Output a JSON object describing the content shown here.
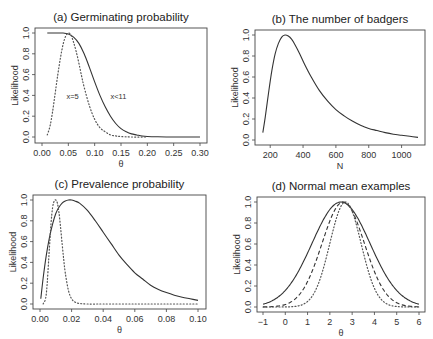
{
  "chart_data": [
    {
      "id": "a",
      "type": "line",
      "title": "(a) Germinating probability",
      "xlabel": "θ",
      "ylabel": "Likelihood",
      "xlim": [
        0.0,
        0.3
      ],
      "ylim": [
        0.0,
        1.0
      ],
      "xticks": [
        0.0,
        0.05,
        0.1,
        0.15,
        0.2,
        0.25,
        0.3
      ],
      "xtick_labels": [
        "0.00",
        "0.05",
        "0.10",
        "0.15",
        "0.20",
        "0.25",
        "0.30"
      ],
      "yticks": [
        0.0,
        0.2,
        0.4,
        0.6,
        0.8,
        1.0
      ],
      "ytick_labels": [
        "0.0",
        "0.2",
        "0.4",
        "0.6",
        "0.8",
        "1.0"
      ],
      "annotations": [
        {
          "text": "x=5",
          "x": 0.058,
          "y": 0.39
        },
        {
          "text": "x<11",
          "x": 0.145,
          "y": 0.39
        }
      ],
      "series": [
        {
          "name": "x<11",
          "style": "solid",
          "x": [
            0.01,
            0.02,
            0.03,
            0.04,
            0.05,
            0.06,
            0.07,
            0.08,
            0.09,
            0.1,
            0.11,
            0.12,
            0.13,
            0.14,
            0.15,
            0.16,
            0.17,
            0.18,
            0.19,
            0.2,
            0.22,
            0.25,
            0.3
          ],
          "y": [
            1.0,
            1.0,
            1.0,
            1.0,
            0.99,
            0.96,
            0.9,
            0.8,
            0.67,
            0.53,
            0.4,
            0.29,
            0.2,
            0.13,
            0.08,
            0.05,
            0.03,
            0.02,
            0.01,
            0.005,
            0.002,
            0.0,
            0.0
          ]
        },
        {
          "name": "x=5",
          "style": "dotted",
          "x": [
            0.01,
            0.015,
            0.02,
            0.025,
            0.03,
            0.035,
            0.04,
            0.045,
            0.05,
            0.055,
            0.06,
            0.065,
            0.07,
            0.075,
            0.08,
            0.09,
            0.1,
            0.11,
            0.12,
            0.13,
            0.14,
            0.15,
            0.17,
            0.2
          ],
          "y": [
            0.02,
            0.1,
            0.24,
            0.42,
            0.6,
            0.76,
            0.89,
            0.97,
            1.0,
            0.98,
            0.91,
            0.82,
            0.71,
            0.59,
            0.48,
            0.3,
            0.17,
            0.09,
            0.05,
            0.02,
            0.01,
            0.005,
            0.0,
            0.0
          ]
        }
      ]
    },
    {
      "id": "b",
      "type": "line",
      "title": "(b) The number of badgers",
      "xlabel": "N",
      "ylabel": "Likelihood",
      "xlim": [
        150,
        1100
      ],
      "ylim": [
        0.0,
        1.0
      ],
      "xticks": [
        200,
        400,
        600,
        800,
        1000
      ],
      "xtick_labels": [
        "200",
        "400",
        "600",
        "800",
        "1000"
      ],
      "yticks": [
        0.0,
        0.2,
        0.4,
        0.6,
        0.8,
        1.0
      ],
      "ytick_labels": [
        "0.0",
        "0.2",
        "0.4",
        "0.6",
        "0.8",
        "1.0"
      ],
      "series": [
        {
          "name": "likelihood",
          "style": "solid",
          "x": [
            155,
            170,
            190,
            210,
            230,
            250,
            270,
            290,
            310,
            330,
            350,
            380,
            410,
            450,
            500,
            550,
            600,
            650,
            700,
            750,
            800,
            850,
            900,
            950,
            1000,
            1050,
            1100
          ],
          "y": [
            0.07,
            0.22,
            0.45,
            0.66,
            0.82,
            0.92,
            0.98,
            1.0,
            0.99,
            0.96,
            0.91,
            0.82,
            0.72,
            0.6,
            0.47,
            0.37,
            0.29,
            0.23,
            0.18,
            0.14,
            0.11,
            0.09,
            0.07,
            0.055,
            0.045,
            0.035,
            0.025
          ]
        }
      ]
    },
    {
      "id": "c",
      "type": "line",
      "title": "(c) Prevalence probability",
      "xlabel": "θ",
      "ylabel": "Likelihood",
      "xlim": [
        0.0,
        0.1
      ],
      "ylim": [
        0.0,
        1.0
      ],
      "xticks": [
        0.0,
        0.02,
        0.04,
        0.06,
        0.08,
        0.1
      ],
      "xtick_labels": [
        "0.00",
        "0.02",
        "0.04",
        "0.06",
        "0.08",
        "0.10"
      ],
      "yticks": [
        0.0,
        0.2,
        0.4,
        0.6,
        0.8,
        1.0
      ],
      "ytick_labels": [
        "0.0",
        "0.2",
        "0.4",
        "0.6",
        "0.8",
        "1.0"
      ],
      "series": [
        {
          "name": "solid",
          "style": "solid",
          "x": [
            0.0005,
            0.002,
            0.004,
            0.006,
            0.008,
            0.01,
            0.012,
            0.014,
            0.016,
            0.018,
            0.02,
            0.022,
            0.025,
            0.03,
            0.035,
            0.04,
            0.045,
            0.05,
            0.055,
            0.06,
            0.065,
            0.07,
            0.075,
            0.08,
            0.085,
            0.09,
            0.095,
            0.1
          ],
          "y": [
            0.05,
            0.25,
            0.47,
            0.64,
            0.77,
            0.87,
            0.93,
            0.97,
            0.99,
            1.0,
            1.0,
            0.99,
            0.97,
            0.9,
            0.8,
            0.69,
            0.58,
            0.47,
            0.38,
            0.3,
            0.24,
            0.18,
            0.14,
            0.11,
            0.085,
            0.065,
            0.05,
            0.035
          ]
        },
        {
          "name": "dotted",
          "style": "dotted",
          "x": [
            0.002,
            0.004,
            0.006,
            0.007,
            0.008,
            0.009,
            0.01,
            0.011,
            0.012,
            0.013,
            0.014,
            0.015,
            0.016,
            0.018,
            0.02,
            0.022,
            0.025,
            0.03,
            0.04,
            0.06,
            0.08,
            0.1
          ],
          "y": [
            0.0,
            0.1,
            0.55,
            0.78,
            0.93,
            0.99,
            1.0,
            0.97,
            0.88,
            0.74,
            0.58,
            0.43,
            0.3,
            0.13,
            0.05,
            0.02,
            0.005,
            0.0,
            0.0,
            0.0,
            0.0,
            0.0
          ]
        }
      ]
    },
    {
      "id": "d",
      "type": "line",
      "title": "(d) Normal mean examples",
      "xlabel": "θ",
      "ylabel": "Likelihood",
      "xlim": [
        -1,
        6
      ],
      "ylim": [
        0.0,
        1.0
      ],
      "xticks": [
        -1,
        0,
        1,
        2,
        3,
        4,
        5,
        6
      ],
      "xtick_labels": [
        "−1",
        "0",
        "1",
        "2",
        "3",
        "4",
        "5",
        "6"
      ],
      "yticks": [
        0.0,
        0.2,
        0.4,
        0.6,
        0.8,
        1.0
      ],
      "ytick_labels": [
        "0.0",
        "0.2",
        "0.4",
        "0.6",
        "0.8",
        "1.0"
      ],
      "series": [
        {
          "name": "solid",
          "style": "solid",
          "mean": 2.5,
          "sd": 1.3
        },
        {
          "name": "dashed",
          "style": "dashed",
          "mean": 2.6,
          "sd": 0.95
        },
        {
          "name": "dotted",
          "style": "dotted",
          "mean": 2.7,
          "sd": 0.7
        }
      ]
    }
  ],
  "layout": {
    "boxes": {
      "a": {
        "x0": 35,
        "y0": 28,
        "x1": 207,
        "y1": 143,
        "px0": 42,
        "px1": 200,
        "py0": 137,
        "py1": 33
      },
      "b": {
        "x0": 255,
        "y0": 30,
        "x1": 425,
        "y1": 145,
        "px0": 262,
        "px1": 418,
        "py0": 140,
        "py1": 35
      },
      "c": {
        "x0": 33,
        "y0": 195,
        "x1": 206,
        "y1": 309,
        "px0": 40,
        "px1": 198,
        "py0": 304,
        "py1": 200
      },
      "d": {
        "x0": 257,
        "y0": 197,
        "x1": 425,
        "y1": 312,
        "px0": 263,
        "px1": 419,
        "py0": 307,
        "py1": 202
      }
    }
  }
}
